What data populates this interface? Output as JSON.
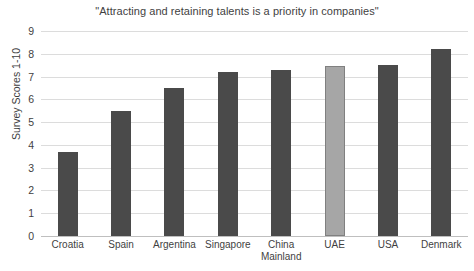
{
  "chart_data": {
    "type": "bar",
    "title": "\"Attracting and retaining talents is a priority in companies\"",
    "xlabel": "",
    "ylabel": "Survey Scores 1-10",
    "categories": [
      "Croatia",
      "Spain",
      "Argentina",
      "Singapore",
      "China Mainland",
      "UAE",
      "USA",
      "Denmark"
    ],
    "values": [
      3.7,
      5.5,
      6.5,
      7.2,
      7.3,
      7.45,
      7.5,
      8.2
    ],
    "ylim": [
      0,
      9
    ],
    "yticks": [
      0,
      1,
      2,
      3,
      4,
      5,
      6,
      7,
      8,
      9
    ],
    "grid": true,
    "legend": "none",
    "highlight_category": "UAE",
    "colors": {
      "bar": "#4a4a4a",
      "bar_highlight": "#a6a6a6",
      "bar_highlight_border": "#808080",
      "gridline": "#dcdcdc",
      "axis": "#bfbfbf",
      "text": "#3f3f3f",
      "background": "#ffffff"
    }
  },
  "labels": {
    "y_tick_9": "9",
    "y_tick_8": "8",
    "y_tick_7": "7",
    "y_tick_6": "6",
    "y_tick_5": "5",
    "y_tick_4": "4",
    "y_tick_3": "3",
    "y_tick_2": "2",
    "y_tick_1": "1",
    "y_tick_0": "0"
  }
}
